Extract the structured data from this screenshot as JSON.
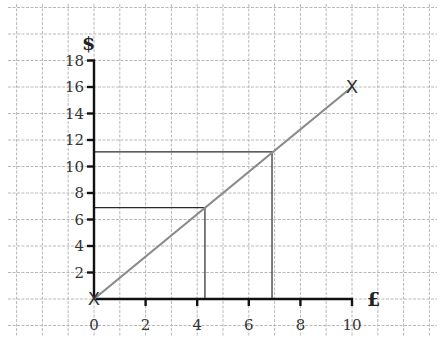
{
  "chart_data": {
    "type": "line",
    "title": "",
    "xlabel": "£",
    "ylabel": "$",
    "xlim": [
      0,
      10
    ],
    "ylim": [
      0,
      18
    ],
    "x_ticks": [
      0,
      2,
      4,
      6,
      8,
      10
    ],
    "y_ticks": [
      2,
      4,
      6,
      8,
      10,
      12,
      14,
      16,
      18
    ],
    "x_tick_labels": [
      "0",
      "2",
      "4",
      "6",
      "8",
      "10"
    ],
    "y_tick_labels": [
      "2",
      "4",
      "6",
      "8",
      "10",
      "12",
      "14",
      "16",
      "18"
    ],
    "grid": true,
    "legend": null,
    "series": [
      {
        "name": "conversion",
        "x": [
          0,
          10
        ],
        "y": [
          0,
          16
        ],
        "color": "#8a8a8a",
        "marker": "X"
      }
    ],
    "reference_lines": [
      {
        "x": 4.3,
        "y": 6.9
      },
      {
        "x": 6.9,
        "y": 11.1
      }
    ],
    "annotations": [
      {
        "text": "X",
        "x": 0,
        "y": 0
      },
      {
        "text": "X",
        "x": 10,
        "y": 16
      }
    ]
  },
  "labels": {
    "y_axis": "$",
    "x_axis": "£",
    "marker_origin": "X",
    "marker_end": "X"
  },
  "ticks": {
    "x": [
      "0",
      "2",
      "4",
      "6",
      "8",
      "10"
    ],
    "y": [
      "2",
      "4",
      "6",
      "8",
      "10",
      "12",
      "14",
      "16",
      "18"
    ]
  }
}
